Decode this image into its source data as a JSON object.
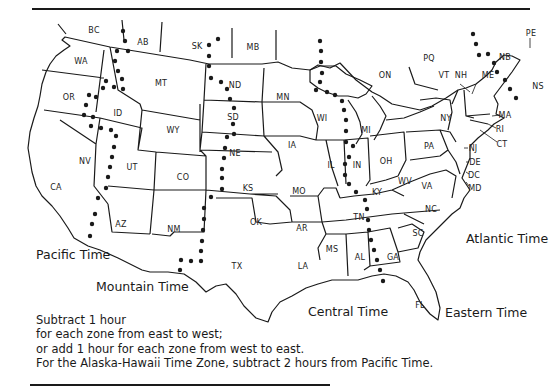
{
  "map": {
    "title": "",
    "states": [
      {
        "code": "BC",
        "x": 94,
        "y": 30
      },
      {
        "code": "AB",
        "x": 143,
        "y": 42
      },
      {
        "code": "SK",
        "x": 197,
        "y": 46
      },
      {
        "code": "MB",
        "x": 253,
        "y": 47
      },
      {
        "code": "WA",
        "x": 81,
        "y": 61
      },
      {
        "code": "MT",
        "x": 161,
        "y": 83
      },
      {
        "code": "ND",
        "x": 235,
        "y": 85
      },
      {
        "code": "MN",
        "x": 283,
        "y": 97
      },
      {
        "code": "OR",
        "x": 69,
        "y": 97
      },
      {
        "code": "ID",
        "x": 118,
        "y": 113
      },
      {
        "code": "WY",
        "x": 173,
        "y": 130
      },
      {
        "code": "SD",
        "x": 233,
        "y": 117
      },
      {
        "code": "WI",
        "x": 322,
        "y": 118
      },
      {
        "code": "MI",
        "x": 366,
        "y": 130
      },
      {
        "code": "IA",
        "x": 292,
        "y": 145
      },
      {
        "code": "NE",
        "x": 235,
        "y": 153
      },
      {
        "code": "NV",
        "x": 85,
        "y": 161
      },
      {
        "code": "UT",
        "x": 132,
        "y": 167
      },
      {
        "code": "CO",
        "x": 183,
        "y": 177
      },
      {
        "code": "KS",
        "x": 248,
        "y": 188
      },
      {
        "code": "IL",
        "x": 331,
        "y": 165
      },
      {
        "code": "IN",
        "x": 357,
        "y": 165
      },
      {
        "code": "OH",
        "x": 386,
        "y": 161
      },
      {
        "code": "MO",
        "x": 299,
        "y": 191
      },
      {
        "code": "CA",
        "x": 56,
        "y": 187
      },
      {
        "code": "KY",
        "x": 377,
        "y": 192
      },
      {
        "code": "WV",
        "x": 405,
        "y": 181
      },
      {
        "code": "VA",
        "x": 427,
        "y": 186
      },
      {
        "code": "AZ",
        "x": 121,
        "y": 224
      },
      {
        "code": "NM",
        "x": 174,
        "y": 229
      },
      {
        "code": "OK",
        "x": 256,
        "y": 222
      },
      {
        "code": "AR",
        "x": 302,
        "y": 228
      },
      {
        "code": "TN",
        "x": 359,
        "y": 217
      },
      {
        "code": "NC",
        "x": 431,
        "y": 209
      },
      {
        "code": "TX",
        "x": 237,
        "y": 266
      },
      {
        "code": "MS",
        "x": 332,
        "y": 249
      },
      {
        "code": "AL",
        "x": 360,
        "y": 257
      },
      {
        "code": "GA",
        "x": 393,
        "y": 257
      },
      {
        "code": "SC",
        "x": 418,
        "y": 233
      },
      {
        "code": "LA",
        "x": 303,
        "y": 266
      },
      {
        "code": "FL",
        "x": 420,
        "y": 305
      },
      {
        "code": "ON",
        "x": 385,
        "y": 75
      },
      {
        "code": "PQ",
        "x": 429,
        "y": 58
      },
      {
        "code": "VT",
        "x": 444,
        "y": 75
      },
      {
        "code": "NH",
        "x": 461,
        "y": 75
      },
      {
        "code": "ME",
        "x": 488,
        "y": 75
      },
      {
        "code": "NB",
        "x": 505,
        "y": 57
      },
      {
        "code": "PE",
        "x": 531,
        "y": 33
      },
      {
        "code": "NS",
        "x": 538,
        "y": 86
      },
      {
        "code": "NY",
        "x": 446,
        "y": 118
      },
      {
        "code": "PA",
        "x": 429,
        "y": 146
      },
      {
        "code": "MA",
        "x": 505,
        "y": 115
      },
      {
        "code": "RI",
        "x": 500,
        "y": 129
      },
      {
        "code": "CT",
        "x": 502,
        "y": 144
      },
      {
        "code": "NJ",
        "x": 473,
        "y": 148
      },
      {
        "code": "DE",
        "x": 475,
        "y": 162
      },
      {
        "code": "DC",
        "x": 474,
        "y": 175
      },
      {
        "code": "MD",
        "x": 475,
        "y": 188
      }
    ],
    "zones": [
      {
        "name": "Pacific Time",
        "x": 36,
        "y": 255
      },
      {
        "name": "Mountain Time",
        "x": 96,
        "y": 287
      },
      {
        "name": "Central Time",
        "x": 308,
        "y": 312
      },
      {
        "name": "Eastern Time",
        "x": 445,
        "y": 313
      },
      {
        "name": "Atlantic Time",
        "x": 466,
        "y": 239
      }
    ]
  },
  "note": {
    "line1": "Subtract 1 hour",
    "line2": "for each zone from east to west;",
    "line3": "or add 1 hour for each zone from west to east.",
    "line4": "For the Alaska-Hawaii Time Zone, subtract 2 hours from Pacific Time."
  },
  "colors": {
    "ink": "#1a1a1a",
    "paper": "#ffffff"
  }
}
